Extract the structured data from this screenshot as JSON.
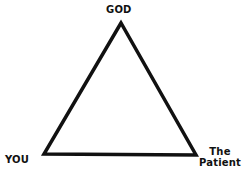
{
  "diagram": {
    "type": "triangle",
    "vertices": {
      "top": {
        "label": "GOD"
      },
      "bottom_left": {
        "label": "YOU"
      },
      "bottom_right": {
        "label_line1": "The",
        "label_line2": "Patient"
      }
    },
    "colors": {
      "stroke": "#111111",
      "background": "#ffffff"
    }
  }
}
